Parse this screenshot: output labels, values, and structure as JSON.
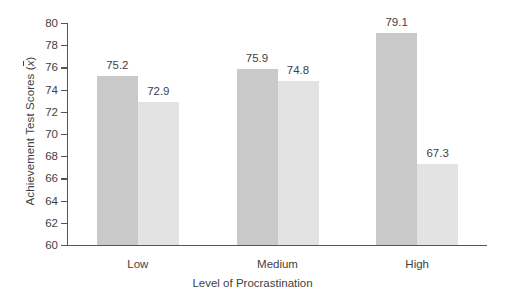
{
  "chart_data": {
    "type": "bar",
    "title": "",
    "categories": [
      "Low",
      "Medium",
      "High"
    ],
    "series": [
      {
        "name": "series-a",
        "values": [
          75.2,
          75.9,
          79.1
        ],
        "color": "#c9c9c9"
      },
      {
        "name": "series-b",
        "values": [
          72.9,
          74.8,
          67.3
        ],
        "color": "#e3e3e3"
      }
    ],
    "xlabel": "Level of Procrastination",
    "ylabel": "Achievement Test Scores (x̄)",
    "ylabel_prefix": "Achievement Test Scores (",
    "ylabel_symbol": "x",
    "ylabel_suffix": ")",
    "ylim": [
      60,
      80
    ],
    "yticks": [
      80,
      78,
      76,
      74,
      72,
      70,
      68,
      66,
      64,
      62,
      60
    ],
    "ytick_labels": [
      "80",
      "78",
      "76",
      "74",
      "72",
      "70",
      "68",
      "66",
      "64",
      "62",
      "60"
    ],
    "grid": false,
    "legend": "none",
    "data_labels": [
      "75.2",
      "72.9",
      "75.9",
      "74.8",
      "79.1",
      "67.3"
    ]
  }
}
